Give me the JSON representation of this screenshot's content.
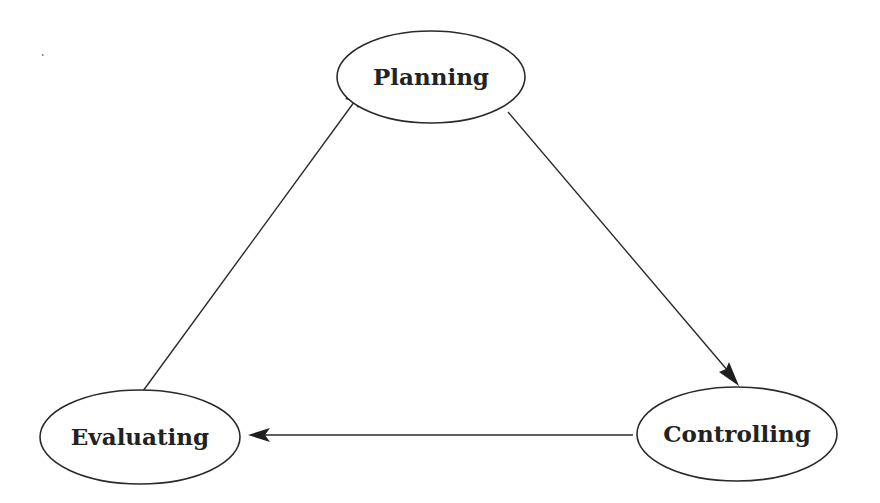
{
  "diagram": {
    "type": "cycle",
    "nodes": [
      {
        "id": "planning",
        "label": "Planning",
        "cx": 431,
        "cy": 77,
        "rx": 95,
        "ry": 46
      },
      {
        "id": "controlling",
        "label": "Controlling",
        "cx": 737,
        "cy": 434,
        "rx": 100,
        "ry": 48
      },
      {
        "id": "evaluating",
        "label": "Evaluating",
        "cx": 140,
        "cy": 436,
        "rx": 100,
        "ry": 48
      }
    ],
    "edges": [
      {
        "from": "planning",
        "to": "controlling",
        "directed": true
      },
      {
        "from": "controlling",
        "to": "evaluating",
        "directed": true
      },
      {
        "from": "evaluating",
        "to": "planning",
        "directed": true
      }
    ],
    "colors": {
      "stroke": "#2a2a2a",
      "text": "#222222",
      "background": "#ffffff"
    }
  }
}
